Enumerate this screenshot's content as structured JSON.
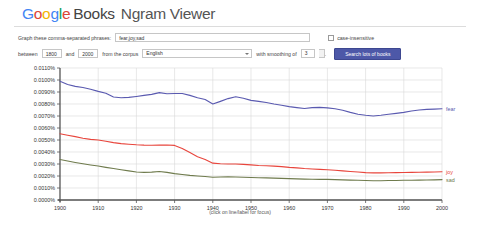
{
  "header": {
    "logo_g1": "G",
    "logo_o1": "o",
    "logo_o2": "o",
    "logo_g2": "g",
    "logo_l": "l",
    "logo_e": "e",
    "books": "Books",
    "product": "Ngram Viewer"
  },
  "form": {
    "phrases_label": "Graph these comma-separated phrases:",
    "phrases_value": "fear,joy,sad",
    "phrases_placeholder": "",
    "case_insensitive_label": "case-insensitive",
    "case_insensitive_checked": false,
    "between_label": "between",
    "start_year": "1800",
    "and_label": "and",
    "end_year": "2000",
    "corpus_label": "from the corpus",
    "corpus_value": "English",
    "smoothing_label": "with smoothing of",
    "smoothing_value": "3",
    "smoothing_suffix": ".",
    "search_button": "Search lots of books"
  },
  "chart_caption": "(click on line/label for focus)",
  "colors": {
    "fear": "#5a5ab0",
    "joy": "#e8453c",
    "sad": "#6f7b4d",
    "grid": "#d9d9d9",
    "axis": "#555555",
    "button": "#4d58a8"
  },
  "chart_data": {
    "type": "line",
    "title": "",
    "xlabel": "",
    "ylabel": "",
    "xlim": [
      1900,
      2000
    ],
    "ylim": [
      0.0,
      0.011
    ],
    "grid": true,
    "legend_position": "right-inline",
    "x_ticks": [
      1900,
      1910,
      1920,
      1930,
      1940,
      1950,
      1960,
      1970,
      1980,
      1990,
      2000
    ],
    "y_ticks": [
      0.0,
      0.001,
      0.002,
      0.003,
      0.004,
      0.005,
      0.006,
      0.007,
      0.008,
      0.009,
      0.01,
      0.011
    ],
    "y_tick_labels": [
      "0.0000%",
      "0.0010%",
      "0.0020%",
      "0.0030%",
      "0.0040%",
      "0.0050%",
      "0.0060%",
      "0.0070%",
      "0.0080%",
      "0.0090%",
      "0.0100%",
      "0.0110%"
    ],
    "x": [
      1900,
      1902,
      1904,
      1906,
      1908,
      1910,
      1912,
      1914,
      1916,
      1918,
      1920,
      1922,
      1924,
      1926,
      1928,
      1930,
      1932,
      1934,
      1936,
      1938,
      1940,
      1942,
      1944,
      1946,
      1948,
      1950,
      1952,
      1954,
      1956,
      1958,
      1960,
      1962,
      1964,
      1966,
      1968,
      1970,
      1972,
      1974,
      1976,
      1978,
      1980,
      1982,
      1984,
      1986,
      1988,
      1990,
      1992,
      1994,
      1996,
      1998,
      2000
    ],
    "series": [
      {
        "name": "fear",
        "color": "#5a5ab0",
        "label": "fear",
        "values": [
          0.0099,
          0.00963,
          0.00947,
          0.00938,
          0.00923,
          0.00905,
          0.0089,
          0.00858,
          0.00852,
          0.00855,
          0.00863,
          0.00872,
          0.0088,
          0.00895,
          0.00886,
          0.00888,
          0.00888,
          0.00872,
          0.00852,
          0.00838,
          0.008,
          0.00822,
          0.00845,
          0.0086,
          0.00848,
          0.0083,
          0.00822,
          0.00812,
          0.008,
          0.0079,
          0.00778,
          0.0077,
          0.00763,
          0.0077,
          0.00772,
          0.00768,
          0.0076,
          0.00748,
          0.0073,
          0.00715,
          0.00706,
          0.007,
          0.00706,
          0.00715,
          0.00722,
          0.0073,
          0.00742,
          0.0075,
          0.00755,
          0.00757,
          0.0076
        ]
      },
      {
        "name": "joy",
        "color": "#e8453c",
        "label": "joy",
        "values": [
          0.00552,
          0.0054,
          0.00528,
          0.00515,
          0.00505,
          0.005,
          0.0049,
          0.00478,
          0.0047,
          0.00465,
          0.0046,
          0.00457,
          0.00456,
          0.00457,
          0.00458,
          0.00455,
          0.0043,
          0.00395,
          0.0036,
          0.00338,
          0.00307,
          0.00302,
          0.003,
          0.003,
          0.00297,
          0.00293,
          0.00288,
          0.00285,
          0.00282,
          0.00278,
          0.00272,
          0.00268,
          0.00262,
          0.00258,
          0.00255,
          0.00252,
          0.00248,
          0.00243,
          0.00238,
          0.00233,
          0.00228,
          0.00226,
          0.00226,
          0.00227,
          0.00228,
          0.00229,
          0.0023,
          0.00231,
          0.00232,
          0.00233,
          0.00235
        ]
      },
      {
        "name": "sad",
        "color": "#6f7b4d",
        "label": "sad",
        "values": [
          0.00338,
          0.00325,
          0.00313,
          0.00302,
          0.00292,
          0.00283,
          0.00272,
          0.00262,
          0.00252,
          0.00243,
          0.00233,
          0.0023,
          0.00232,
          0.00238,
          0.0023,
          0.0022,
          0.00212,
          0.00205,
          0.002,
          0.00196,
          0.0019,
          0.00192,
          0.00193,
          0.00192,
          0.0019,
          0.00188,
          0.00186,
          0.00184,
          0.00182,
          0.0018,
          0.00178,
          0.00176,
          0.00174,
          0.00173,
          0.00172,
          0.00172,
          0.0017,
          0.00168,
          0.00166,
          0.00164,
          0.00162,
          0.00161,
          0.00161,
          0.00162,
          0.00163,
          0.00164,
          0.00165,
          0.00166,
          0.00167,
          0.00168,
          0.0017
        ]
      }
    ]
  }
}
